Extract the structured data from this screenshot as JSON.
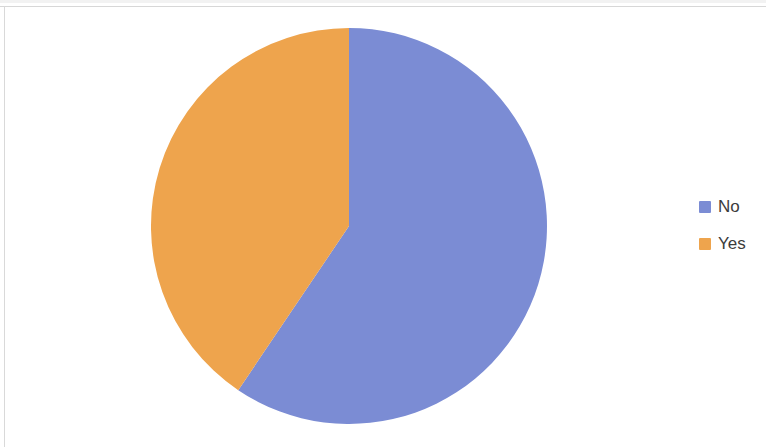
{
  "chart_data": {
    "type": "pie",
    "title": "",
    "subtitle": "",
    "xlabel": "",
    "ylabel": "",
    "grid": false,
    "legend_position": "right",
    "start_angle_deg": 0,
    "direction": "clockwise",
    "categories": [
      "No",
      "Yes"
    ],
    "values": [
      59.4,
      40.6
    ],
    "slices": [
      {
        "label": "No",
        "value": 59.4,
        "percent": "59.4%",
        "color": "#7b8cd4",
        "start_angle_deg": 0,
        "end_angle_deg": 214
      },
      {
        "label": "Yes",
        "value": 40.6,
        "percent": "40.6%",
        "color": "#eea44d",
        "start_angle_deg": 214,
        "end_angle_deg": 360
      }
    ],
    "legend": [
      {
        "label": "No",
        "color": "#7b8cd4"
      },
      {
        "label": "Yes",
        "color": "#eea44d"
      }
    ],
    "annotations": []
  },
  "colors": {
    "background": "#ffffff",
    "frame_line": "#d9d9d9",
    "legend_text": "#3c3c3c",
    "series_no": "#7b8cd4",
    "series_yes": "#eea44d"
  }
}
